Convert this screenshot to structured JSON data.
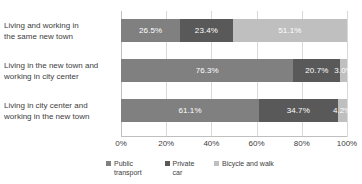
{
  "chart_data": {
    "type": "bar",
    "orientation": "horizontal",
    "stacked": true,
    "normalized_percent": true,
    "title": "",
    "subtitle": "",
    "xlabel": "",
    "ylabel": "",
    "xlim": [
      0,
      100
    ],
    "xticks": [
      "0%",
      "20%",
      "40%",
      "60%",
      "80%",
      "100%"
    ],
    "xtick_values": [
      0,
      20,
      40,
      60,
      80,
      100
    ],
    "grid": "vertical",
    "legend_position": "bottom",
    "categories": [
      "Living and working in the same new town",
      "Living in the new town and working in city center",
      "Living in city center and working in the new town"
    ],
    "category_lines": [
      [
        "Living and working in",
        "the same new town"
      ],
      [
        "Living in the new town and",
        "working in city center"
      ],
      [
        "Living in city center and",
        "working in the new town"
      ]
    ],
    "series": [
      {
        "name": "Public transport",
        "name_lines": [
          "Public",
          "transport"
        ],
        "color": "#808080",
        "values": [
          26.5,
          76.3,
          61.1
        ],
        "labels": [
          "26.5%",
          "76.3%",
          "61.1%"
        ]
      },
      {
        "name": "Private car",
        "name_lines": [
          "Private",
          "car"
        ],
        "color": "#595959",
        "values": [
          23.4,
          20.7,
          34.7
        ],
        "labels": [
          "23.4%",
          "20.7%",
          "34.7%"
        ]
      },
      {
        "name": "Bicycle and walk",
        "name_lines": [
          "Bicycle and walk",
          ""
        ],
        "color": "#bfbfbf",
        "values": [
          51.1,
          3.0,
          4.2
        ],
        "labels": [
          "51.1%",
          "3.0%",
          "4.2%"
        ]
      }
    ],
    "colors": {
      "public_transport": "#808080",
      "private_car": "#595959",
      "bicycle_and_walk": "#bfbfbf",
      "gridline": "#d9d9d9",
      "axis": "#bfbfbf",
      "text": "#404040",
      "bar_label": "#ffffff",
      "background": "#ffffff"
    }
  }
}
